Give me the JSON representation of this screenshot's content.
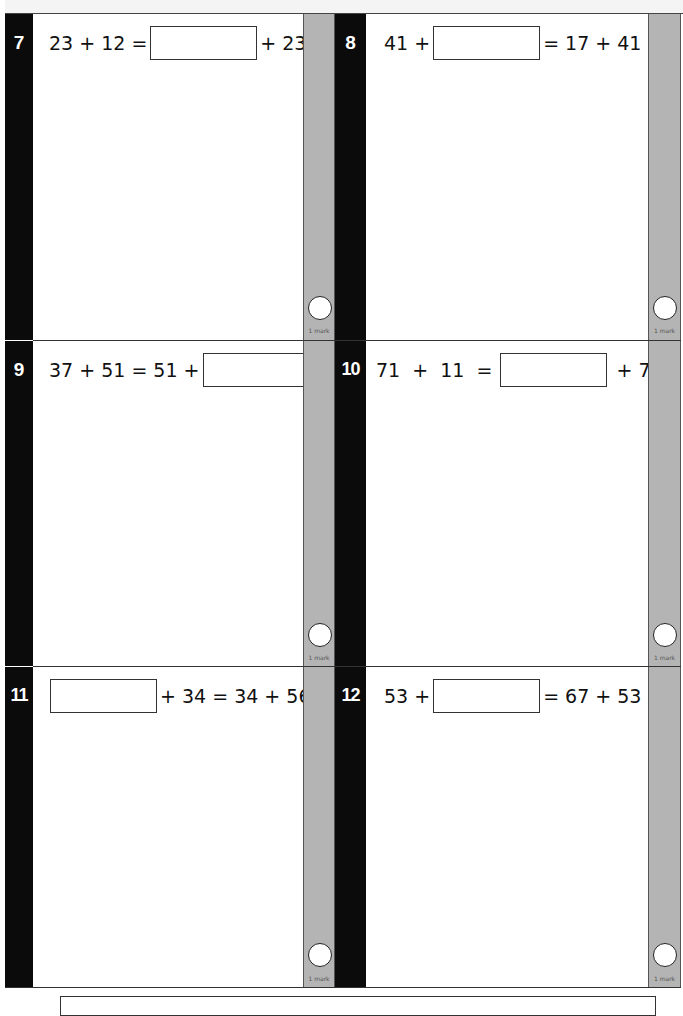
{
  "page": {
    "type": "arithmetic worksheet - commutative addition",
    "mark_label": "1 mark"
  },
  "questions": [
    {
      "number": "7",
      "parts": [
        "23 + 12 =",
        "[box]",
        "+ 23"
      ],
      "before": "23 + 12 =",
      "after": "+ 23",
      "answer_value": ""
    },
    {
      "number": "8",
      "parts": [
        "41 +",
        "[box]",
        "= 17 + 41"
      ],
      "before": "41 +",
      "after": "= 17 + 41",
      "answer_value": ""
    },
    {
      "number": "9",
      "parts": [
        "37 + 51 = 51 +",
        "[box]"
      ],
      "before": "37 + 51 = 51 +",
      "after": "",
      "answer_value": ""
    },
    {
      "number": "10",
      "parts": [
        "71 + 11 =",
        "[box]",
        "+ 71"
      ],
      "before": "71  +  11  =",
      "after": "+ 71",
      "answer_value": ""
    },
    {
      "number": "11",
      "parts": [
        "[box]",
        "+ 34 = 34 + 56"
      ],
      "before": "",
      "after": "+ 34 = 34 + 56",
      "answer_value": ""
    },
    {
      "number": "12",
      "parts": [
        "53 +",
        "[box]",
        "= 67 + 53"
      ],
      "before": "53 +",
      "after": "= 67 + 53",
      "answer_value": ""
    }
  ],
  "colors": {
    "number_strip": "#0b0b0b",
    "mark_strip": "#b4b4b4",
    "rule": "#333333"
  }
}
